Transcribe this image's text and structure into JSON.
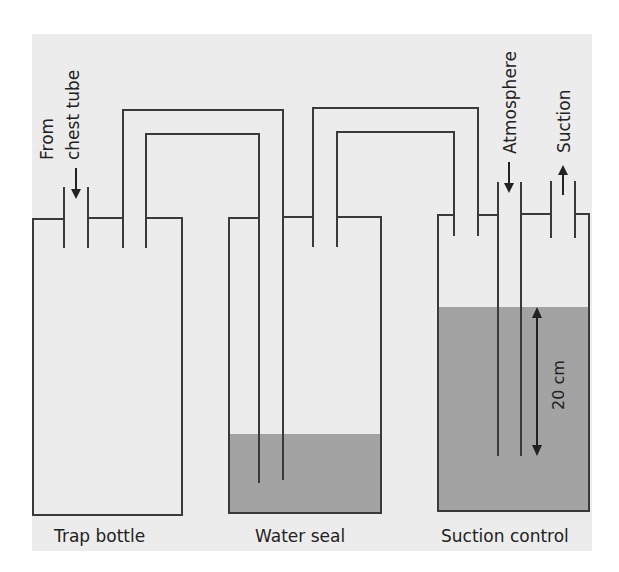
{
  "diagram": {
    "colors": {
      "page_background": "#ffffff",
      "panel_background": "#ececec",
      "water": "#a3a3a3",
      "line": "#3a3a3a",
      "text": "#222222"
    },
    "labels": {
      "from_chest_tube_line1": "From",
      "from_chest_tube_line2": "chest tube",
      "atmosphere": "Atmosphere",
      "suction": "Suction",
      "height": "20 cm"
    },
    "bottles": [
      {
        "name": "Trap bottle",
        "has_water": false
      },
      {
        "name": "Water seal",
        "has_water": true
      },
      {
        "name": "Suction control",
        "has_water": true
      }
    ]
  }
}
